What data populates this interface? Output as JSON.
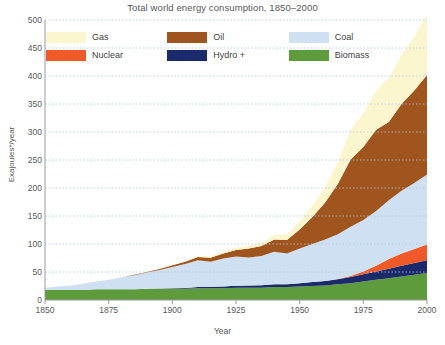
{
  "chart_data": {
    "type": "area",
    "stacked": true,
    "title": "Total world energy consumption, 1850–2000",
    "xlabel": "Year",
    "ylabel": "Exajoules*/year",
    "xlim": [
      1850,
      2000
    ],
    "ylim": [
      0,
      500
    ],
    "grid": true,
    "legend_position": "top-inside",
    "xticks": [
      1850,
      1875,
      1900,
      1925,
      1950,
      1975,
      2000
    ],
    "yticks": [
      0,
      50,
      100,
      150,
      200,
      250,
      300,
      350,
      400,
      450,
      500
    ],
    "x": [
      1850,
      1855,
      1860,
      1865,
      1870,
      1875,
      1880,
      1885,
      1890,
      1895,
      1900,
      1905,
      1910,
      1915,
      1920,
      1925,
      1930,
      1935,
      1940,
      1945,
      1950,
      1955,
      1960,
      1965,
      1970,
      1975,
      1980,
      1985,
      1990,
      1995,
      2000
    ],
    "series": [
      {
        "name": "Biomass",
        "color": "#5e9b3d",
        "stack_order": 1,
        "values": [
          18,
          18,
          18,
          18,
          19,
          19,
          19,
          19,
          20,
          20,
          20,
          20,
          21,
          21,
          21,
          22,
          22,
          22,
          23,
          23,
          24,
          25,
          26,
          28,
          30,
          33,
          36,
          39,
          42,
          45,
          48
        ]
      },
      {
        "name": "Hydro +",
        "color": "#1b2a6b",
        "stack_order": 2,
        "values": [
          0,
          0,
          0,
          0,
          0,
          0,
          0,
          0,
          0,
          0.5,
          1,
          1.5,
          2,
          2.5,
          3,
          3.5,
          4,
          4.5,
          5,
          5,
          6,
          7,
          8,
          9,
          11,
          13,
          15,
          17,
          19,
          21,
          23
        ]
      },
      {
        "name": "Nuclear",
        "color": "#f05a28",
        "stack_order": 3,
        "values": [
          0,
          0,
          0,
          0,
          0,
          0,
          0,
          0,
          0,
          0,
          0,
          0,
          0,
          0,
          0,
          0,
          0,
          0,
          0,
          0,
          0,
          0,
          0,
          0.5,
          2,
          5,
          10,
          17,
          22,
          25,
          28
        ]
      },
      {
        "name": "Coal",
        "color": "#cfe0f2",
        "stack_order": 4,
        "values": [
          4,
          6,
          8,
          11,
          14,
          17,
          21,
          25,
          29,
          33,
          38,
          43,
          48,
          45,
          50,
          52,
          50,
          52,
          58,
          55,
          62,
          68,
          74,
          80,
          88,
          92,
          98,
          105,
          112,
          118,
          125
        ]
      },
      {
        "name": "Oil",
        "color": "#a0541e",
        "stack_order": 5,
        "values": [
          0,
          0,
          0,
          0,
          0,
          0,
          0,
          1,
          1,
          2,
          3,
          4,
          6,
          7,
          9,
          12,
          16,
          18,
          22,
          24,
          34,
          48,
          66,
          90,
          120,
          130,
          145,
          140,
          155,
          165,
          178
        ]
      },
      {
        "name": "Gas",
        "color": "#fbf6cd",
        "stack_order": 6,
        "values": [
          0,
          0,
          0,
          0,
          0,
          0,
          0,
          0,
          0,
          0,
          1,
          1,
          2,
          2,
          3,
          4,
          5,
          6,
          8,
          10,
          14,
          20,
          28,
          38,
          52,
          60,
          70,
          78,
          88,
          96,
          108
        ]
      }
    ],
    "totals_note": {
      "year_2000_total": 510,
      "year_1850_total": 22
    }
  },
  "legend": {
    "items": [
      {
        "label": "Gas",
        "color": "#fbf6cd"
      },
      {
        "label": "Oil",
        "color": "#a0541e"
      },
      {
        "label": "Coal",
        "color": "#cfe0f2"
      },
      {
        "label": "Nuclear",
        "color": "#f05a28"
      },
      {
        "label": "Hydro +",
        "color": "#1b2a6b"
      },
      {
        "label": "Biomass",
        "color": "#5e9b3d"
      }
    ]
  },
  "colors": {
    "gridline": "#a9c6e0",
    "axis": "#9a9a9a",
    "text": "#58595b",
    "background": "#ffffff"
  }
}
